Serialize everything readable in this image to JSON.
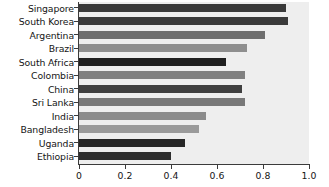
{
  "chart_data": {
    "type": "bar",
    "orientation": "horizontal",
    "title": "",
    "subtitle": "",
    "xlabel": "",
    "ylabel": "",
    "xlim": [
      0,
      1.0
    ],
    "grid": false,
    "legend": "none",
    "x_ticks": [
      "0",
      "0.2",
      "0.4",
      "0.6",
      "0.8",
      "1.0"
    ],
    "x_tick_values": [
      0,
      0.2,
      0.4,
      0.6,
      0.8,
      1.0
    ],
    "plot_background": "#eeeeee",
    "axis_color": "#3b3b3b",
    "categories": [
      "Singapore",
      "South Korea",
      "Argentina",
      "Brazil",
      "South Africa",
      "Colombia",
      "China",
      "Sri Lanka",
      "India",
      "Bangladesh",
      "Uganda",
      "Ethiopia"
    ],
    "values": [
      0.9,
      0.91,
      0.81,
      0.73,
      0.64,
      0.72,
      0.71,
      0.72,
      0.55,
      0.52,
      0.46,
      0.4
    ],
    "bar_colors": [
      "#3a3a3a",
      "#3a3a3a",
      "#6e6e6e",
      "#8e8e8e",
      "#1f1f1f",
      "#808080",
      "#3f3f3f",
      "#787878",
      "#8b8b8b",
      "#9a9a9a",
      "#262626",
      "#2e2e2e"
    ]
  }
}
